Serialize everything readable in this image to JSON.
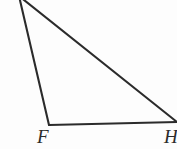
{
  "figure": {
    "name": "triangle-figure",
    "background_color": "#fdfdfd",
    "stroke_color": "#2b2b2b",
    "stroke_width": 2.1,
    "canvas": {
      "width": 177,
      "height": 149
    },
    "vertices": [
      {
        "id": "apex",
        "label": "",
        "x": 19,
        "y": -4,
        "visible_label": false,
        "clipped": true
      },
      {
        "id": "bottom_left",
        "label": "F",
        "x": 49,
        "y": 125,
        "visible_label": true,
        "clipped": false
      },
      {
        "id": "bottom_right",
        "label": "H",
        "x": 176,
        "y": 122,
        "visible_label": true,
        "clipped": true
      }
    ],
    "edges": [
      {
        "id": "edge-apex-f",
        "from": "apex",
        "to": "bottom_left"
      },
      {
        "id": "edge-f-h",
        "from": "bottom_left",
        "to": "bottom_right"
      },
      {
        "id": "edge-apex-h",
        "from": "apex",
        "to": "bottom_right"
      }
    ],
    "labels": {
      "bottom_left": "F",
      "bottom_right": "H"
    }
  }
}
